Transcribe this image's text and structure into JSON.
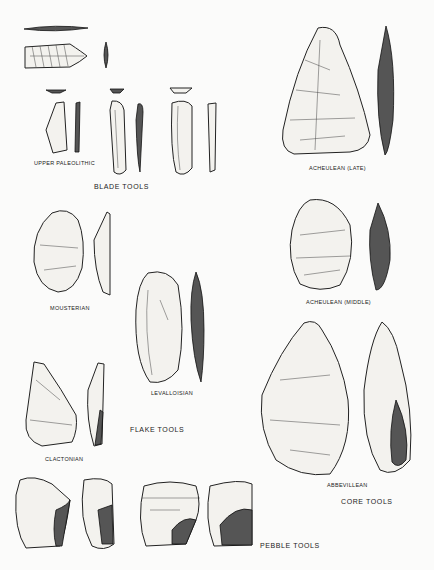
{
  "figure": {
    "groups": [
      {
        "name": "BLADE TOOLS",
        "items": [
          "UPPER PALEOLITHIC"
        ]
      },
      {
        "name": "FLAKE TOOLS",
        "items": [
          "MOUSTERIAN",
          "LEVALLOISIAN",
          "CLACTONIAN"
        ]
      },
      {
        "name": "CORE TOOLS",
        "items": [
          "ACHEULEAN (LATE)",
          "ACHEULEAN (MIDDLE)",
          "ABBEVILLEAN"
        ]
      },
      {
        "name": "PEBBLE TOOLS",
        "items": []
      }
    ]
  },
  "labels": {
    "upper_paleolithic": "UPPER PALEOLITHIC",
    "blade_tools": "BLADE TOOLS",
    "acheulean_late": "ACHEULEAN (LATE)",
    "acheulean_middle": "ACHEULEAN (MIDDLE)",
    "mousterian": "MOUSTERIAN",
    "levalloisian": "LEVALLOISIAN",
    "flake_tools": "FLAKE TOOLS",
    "clactonian": "CLACTONIAN",
    "abbevillean": "ABBEVILLEAN",
    "core_tools": "CORE TOOLS",
    "pebble_tools": "PEBBLE TOOLS"
  }
}
